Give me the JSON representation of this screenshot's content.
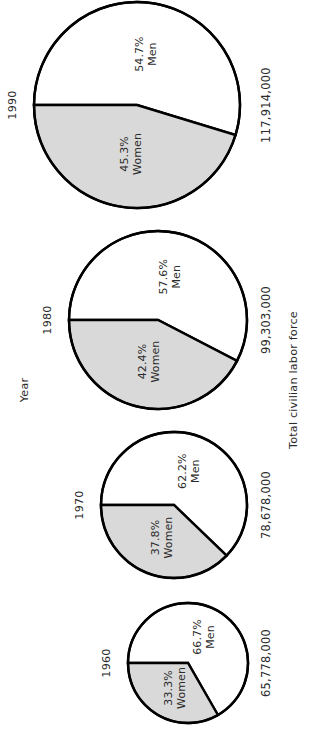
{
  "chart_data": {
    "type": "pie",
    "title": "",
    "subtitle": "",
    "orientation": "rotated-90-ccw",
    "xlabel": "Year",
    "ylabel": "Total civilian labor force",
    "legend_position": "none",
    "grid": false,
    "note": "Four pie charts, one per year, sized proportionally to the total civilian labor force. Each pie is split into Men (white) and Women (shaded) shares.",
    "categories": [
      "Men",
      "Women"
    ],
    "slice_colors": {
      "men": "#ffffff",
      "women": "#d9d9d9",
      "outline": "#000000"
    },
    "pies": [
      {
        "year": "1990",
        "total_label": "117,914,000",
        "total_value": 117914000,
        "slices": [
          {
            "name": "Men",
            "percent": 54.7,
            "percent_label": "54.7%",
            "label": "Men"
          },
          {
            "name": "Women",
            "percent": 45.3,
            "percent_label": "45.3%",
            "label": "Women"
          }
        ]
      },
      {
        "year": "1980",
        "total_label": "99,303,000",
        "total_value": 99303000,
        "slices": [
          {
            "name": "Men",
            "percent": 57.6,
            "percent_label": "57.6%",
            "label": "Men"
          },
          {
            "name": "Women",
            "percent": 42.4,
            "percent_label": "42.4%",
            "label": "Women"
          }
        ]
      },
      {
        "year": "1970",
        "total_label": "78,678,000",
        "total_value": 78678000,
        "slices": [
          {
            "name": "Men",
            "percent": 62.2,
            "percent_label": "62.2%",
            "label": "Men"
          },
          {
            "name": "Women",
            "percent": 37.8,
            "percent_label": "37.8%",
            "label": "Women"
          }
        ]
      },
      {
        "year": "1960",
        "total_label": "65,778,000",
        "total_value": 65778000,
        "slices": [
          {
            "name": "Men",
            "percent": 66.7,
            "percent_label": "66.7%",
            "label": "Men"
          },
          {
            "name": "Women",
            "percent": 33.3,
            "percent_label": "33.3%",
            "label": "Women"
          }
        ]
      }
    ],
    "geometry": [
      {
        "cx": 137,
        "cy": 105,
        "r": 103
      },
      {
        "cx": 158,
        "cy": 320,
        "r": 89
      },
      {
        "cx": 174,
        "cy": 505,
        "r": 73
      },
      {
        "cx": 188,
        "cy": 663,
        "r": 60
      }
    ]
  }
}
